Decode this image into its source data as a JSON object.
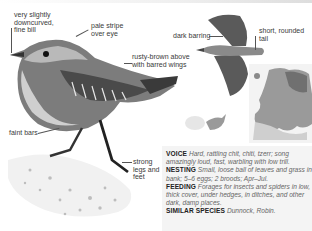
{
  "page": {
    "palette": {
      "background": "#ffffff",
      "panel": "#f4f4f4",
      "panel_rule": "#c8c8c8",
      "text": "#2a2a2a",
      "muted_text": "#666666"
    }
  },
  "annotations": {
    "bill": [
      "very slightly",
      "downcurved,",
      "fine bill"
    ],
    "eye_stripe": [
      "pale stripe",
      "over eye"
    ],
    "upperparts": [
      "rusty-brown above",
      "with barred wings"
    ],
    "flight_barring": [
      "dark barring"
    ],
    "tail": [
      "short, rounded",
      "tail"
    ],
    "flanks": [
      "faint bars"
    ],
    "legs": [
      "strong",
      "legs and",
      "feet"
    ]
  },
  "info": {
    "voice": {
      "key": "VOICE",
      "text": "Hard, rattling chit, chiti, tzerr; song amazingly loud, fast, warbling with low trill."
    },
    "nesting": {
      "key": "NESTING",
      "text": "Small, loose ball of leaves and grass in bank; 5–6 eggs; 2 broods; Apr–Jul."
    },
    "feeding": {
      "key": "FEEDING",
      "text": "Forages for insects and spiders in low, thick cover, under hedges, in ditches, and other dark, damp places."
    },
    "similar": {
      "key": "SIMILAR SPECIES",
      "text": "Dunnock, Robin."
    }
  },
  "icons": {
    "perched_bird": "wren-perched-illustration",
    "flying_bird": "wren-flight-illustration",
    "size_silhouette": "size-comparison-silhouette-icon",
    "range_map": "europe-range-map"
  }
}
